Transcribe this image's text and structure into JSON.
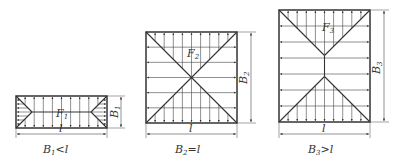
{
  "diagrams": [
    {
      "id": "case-1",
      "panel_label": "F",
      "panel_sub": "1",
      "width_label": "l",
      "height_label": "B",
      "height_sub": "1",
      "caption_main": "B",
      "caption_sub": "1",
      "caption_rel": "<l",
      "relation": "B1 < l"
    },
    {
      "id": "case-2",
      "panel_label": "F",
      "panel_sub": "2",
      "width_label": "l",
      "height_label": "B",
      "height_sub": "2",
      "caption_main": "B",
      "caption_sub": "2",
      "caption_rel": "=l",
      "relation": "B2 = l"
    },
    {
      "id": "case-3",
      "panel_label": "F",
      "panel_sub": "3",
      "width_label": "l",
      "height_label": "B",
      "height_sub": "3",
      "caption_main": "B",
      "caption_sub": "3",
      "caption_rel": ">l",
      "relation": "B3 > l"
    }
  ],
  "colors": {
    "line": "#333333",
    "arrow": "#444444"
  }
}
